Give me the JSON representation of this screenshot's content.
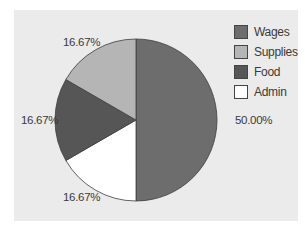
{
  "chart_data": {
    "type": "pie",
    "title": "",
    "categories": [
      "Wages",
      "Supplies",
      "Food",
      "Admin"
    ],
    "values": [
      50.0,
      16.67,
      16.67,
      16.67
    ],
    "labels": [
      "50.00%",
      "16.67%",
      "16.67%",
      "16.67%"
    ],
    "colors": [
      "#6d6d6d",
      "#b5b5b5",
      "#565656",
      "#ffffff"
    ],
    "legend_position": "right-top",
    "start_angle_deg": 0,
    "direction": "clockwise",
    "slice_order_clockwise_from_top": [
      "Wages",
      "Admin",
      "Food",
      "Supplies"
    ]
  },
  "legend": {
    "items": [
      {
        "label": "Wages",
        "color": "#6d6d6d"
      },
      {
        "label": "Supplies",
        "color": "#b5b5b5"
      },
      {
        "label": "Food",
        "color": "#565656"
      },
      {
        "label": "Admin",
        "color": "#ffffff"
      }
    ]
  },
  "slice_labels": {
    "wages": "50.00%",
    "supplies": "16.67%",
    "food": "16.67%",
    "admin": "16.67%"
  },
  "colors": {
    "panel_bg": "#ebebeb",
    "page_bg": "#ffffff",
    "outline": "#3c3c3c"
  }
}
